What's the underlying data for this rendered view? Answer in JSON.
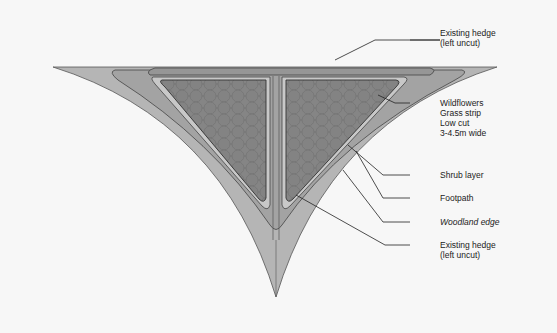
{
  "diagram": {
    "type": "woodland corner planting plan",
    "colors": {
      "background": "#f7f7f7",
      "outer_band": "#b4b4b4",
      "wildflower_strip": "#a2a2a2",
      "footpath": "#bdbdbd",
      "shrub_layer": "#8e8e8e",
      "woodland_fill": "#7d7d7d",
      "outline": "#444444"
    },
    "labels": [
      {
        "id": "existing-hedge-top",
        "lines": [
          "Existing hedge",
          "(left uncut)"
        ],
        "italic": false
      },
      {
        "id": "wildflowers",
        "lines": [
          "Wildflowers",
          "Grass strip",
          "Low cut",
          "3-4.5m wide"
        ],
        "italic": false
      },
      {
        "id": "shrub-layer",
        "lines": [
          "Shrub layer"
        ],
        "italic": false
      },
      {
        "id": "footpath",
        "lines": [
          "Footpath"
        ],
        "italic": false
      },
      {
        "id": "woodland-edge",
        "lines": [
          "Woodland edge"
        ],
        "italic": true
      },
      {
        "id": "existing-hedge-bottom",
        "lines": [
          "Existing hedge",
          "(left uncut)"
        ],
        "italic": false
      }
    ]
  }
}
